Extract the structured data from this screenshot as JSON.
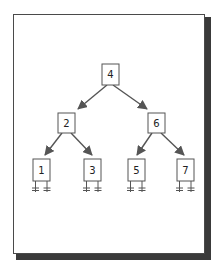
{
  "diagram": {
    "type": "binary-search-tree",
    "colors": {
      "frame_border": "#4a4a4a",
      "frame_shadow": "#3a3a3a",
      "edge": "#555555",
      "node_border": "#555555",
      "text": "#222222"
    },
    "nodes": [
      {
        "id": "n4",
        "label": "4",
        "level": 0
      },
      {
        "id": "n2",
        "label": "2",
        "level": 1
      },
      {
        "id": "n6",
        "label": "6",
        "level": 1
      },
      {
        "id": "n1",
        "label": "1",
        "level": 2,
        "null_children": true
      },
      {
        "id": "n3",
        "label": "3",
        "level": 2,
        "null_children": true
      },
      {
        "id": "n5",
        "label": "5",
        "level": 2,
        "null_children": true
      },
      {
        "id": "n7",
        "label": "7",
        "level": 2,
        "null_children": true
      }
    ],
    "edges": [
      {
        "from": "4",
        "to": "2"
      },
      {
        "from": "4",
        "to": "6"
      },
      {
        "from": "2",
        "to": "1"
      },
      {
        "from": "2",
        "to": "3"
      },
      {
        "from": "6",
        "to": "5"
      },
      {
        "from": "6",
        "to": "7"
      }
    ]
  }
}
